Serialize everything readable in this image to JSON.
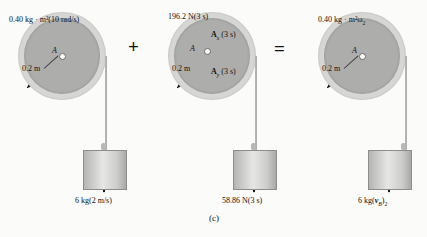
{
  "figure": {
    "caption": "(c)",
    "operators": {
      "plus": "+",
      "equals": "="
    }
  },
  "terms": [
    {
      "id": "initial-momentum",
      "disk": {
        "angular_momentum_label": "0.40 kg · m²(10 rad/s)",
        "center_label": "A",
        "radius_label": "0.2 m",
        "rotation_arrow": "clockwise-arc-arrow"
      },
      "block": {
        "label_prefix": "6 kg(2 m/s)",
        "mass": "6 kg",
        "value": "2 m/s",
        "arrow": "down-arrow"
      }
    },
    {
      "id": "impulse",
      "disk": {
        "weight_label": "196.2 N(3 s)",
        "center_label": "A",
        "radius_label": "0.2 m",
        "force_x": {
          "symbol": "A",
          "subscript": "x",
          "time": "(3 s)",
          "arrow": "right-arrow"
        },
        "force_y": {
          "symbol": "A",
          "subscript": "y",
          "time": "(3 s)",
          "arrow": "up-arrow"
        },
        "weight_arrow": "down-arrow"
      },
      "block": {
        "label_prefix": "58.86 N(3 s)",
        "force": "58.86 N",
        "time": "(3 s)",
        "arrow": "down-arrow"
      }
    },
    {
      "id": "final-momentum",
      "disk": {
        "angular_momentum_label": "0.40 kg · m²ω",
        "angular_momentum_subscript": "2",
        "center_label": "A",
        "radius_label": "0.2 m",
        "rotation_arrow": "clockwise-arc-arrow"
      },
      "block": {
        "mass": "6 kg(",
        "velocity_symbol": "v",
        "velocity_subscript": "B",
        "velocity_close": ")",
        "velocity_index": "2",
        "arrow": "down-arrow"
      }
    }
  ],
  "colors": {
    "disk_outer": "#d6d6d4",
    "disk_inner": "#adadab",
    "block_face": "#e6e6e4",
    "arrow": "#101010",
    "background": "#fbfbfa"
  }
}
